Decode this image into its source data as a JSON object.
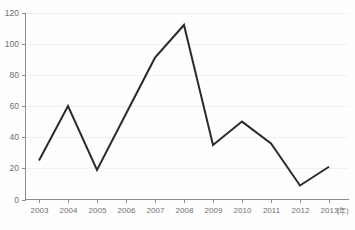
{
  "chart_data": {
    "type": "line",
    "title": "",
    "xlabel": "",
    "ylabel": "",
    "x_unit_label": "(年)",
    "categories": [
      "2003",
      "2004",
      "2005",
      "2006",
      "2007",
      "2008",
      "2009",
      "2010",
      "2011",
      "2012",
      "2013"
    ],
    "values": [
      25,
      60,
      19,
      55,
      91,
      112,
      35,
      50,
      36,
      9,
      21
    ],
    "series": [
      {
        "name": "series-1",
        "values": [
          25,
          60,
          19,
          55,
          91,
          112,
          35,
          50,
          36,
          9,
          21
        ],
        "color": "#2b2b2b"
      }
    ],
    "ylim": [
      0,
      120
    ],
    "y_ticks": [
      0,
      20,
      40,
      60,
      80,
      100,
      120
    ],
    "y_tick_labels": [
      "0",
      "20",
      "40",
      "60",
      "80",
      "100",
      "120"
    ],
    "x_tick_labels": [
      "2003",
      "2004",
      "2005",
      "2006",
      "2007",
      "2008",
      "2009",
      "2010",
      "2011",
      "2012",
      "2013"
    ],
    "grid": true,
    "grid_orientation": "horizontal",
    "legend": false,
    "legend_position": "none",
    "annotations": []
  },
  "colors": {
    "line": "#2b2b2b",
    "grid": "#f0f0f0",
    "axis": "#8c8c8c",
    "tick_text": "#6e6e6e",
    "background": "#fefefe"
  },
  "axes": {
    "y_labels": [
      "120",
      "100",
      "80",
      "60",
      "40",
      "20",
      "0"
    ],
    "x_labels": [
      "2003",
      "2004",
      "2005",
      "2006",
      "2007",
      "2008",
      "2009",
      "2010",
      "2011",
      "2012",
      "2013"
    ],
    "unit": "(年)"
  }
}
